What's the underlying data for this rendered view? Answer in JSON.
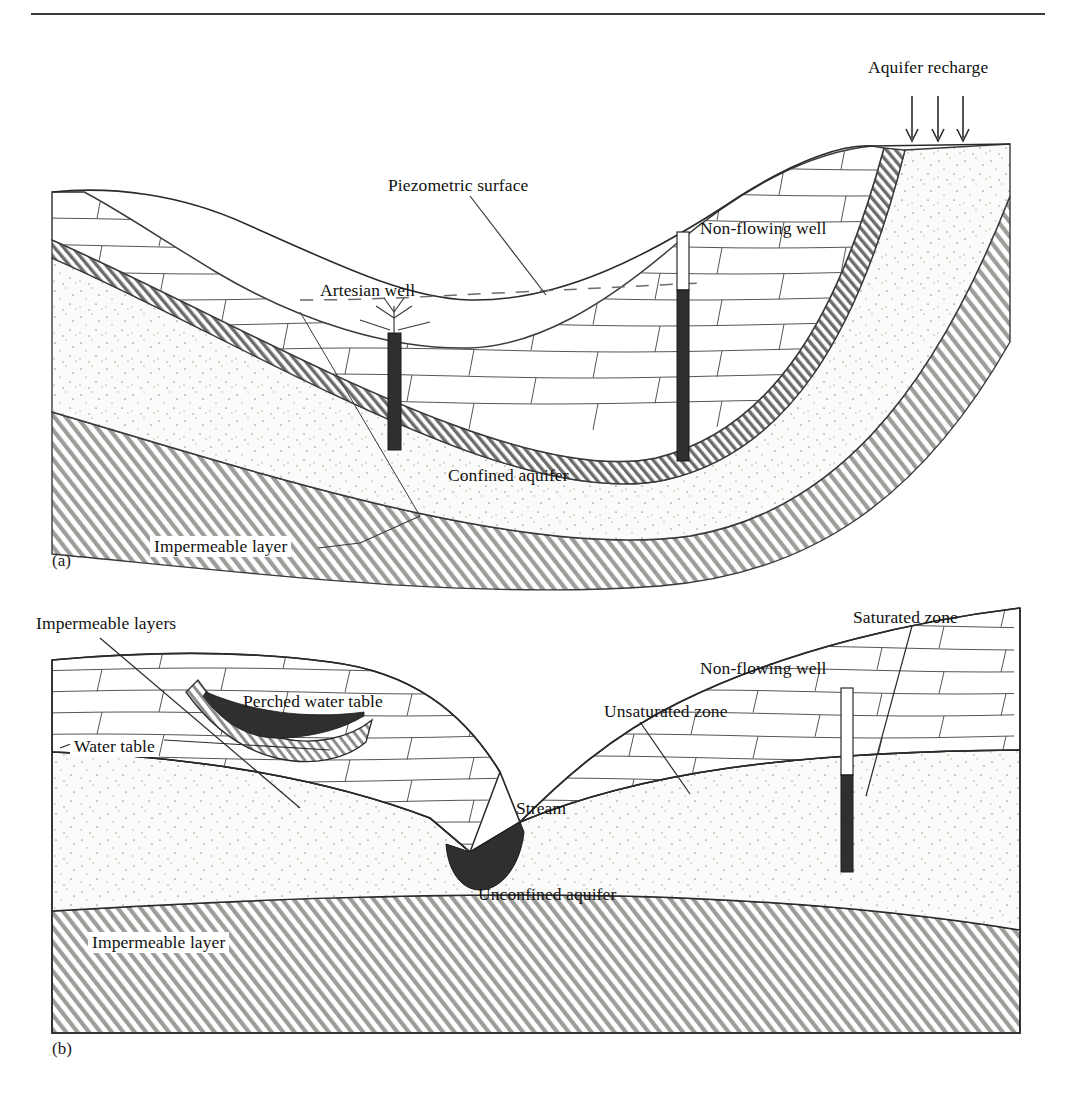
{
  "header": {
    "rule_color": "#3a3a3a",
    "text": ""
  },
  "figure": {
    "caption_tags": {
      "panel_a": "(a)",
      "panel_b": "(b)"
    },
    "line_color": "#2a2a2a",
    "water_fill": "#2f2f2f",
    "sand_fill": "#fbfbfa",
    "hatch_gray": "#8c8c8c"
  },
  "panel_a": {
    "name": "Confined aquifer system with artesian and non-flowing wells",
    "labels": [
      {
        "id": "aquifer-recharge",
        "text": "Aquifer recharge",
        "x": 868,
        "y": 58,
        "leader": false
      },
      {
        "id": "piezometric-surface",
        "text": "Piezometric surface",
        "x": 388,
        "y": 176,
        "leader": true
      },
      {
        "id": "non-flowing-well",
        "text": "Non-flowing well",
        "x": 700,
        "y": 219,
        "leader": false
      },
      {
        "id": "artesian-well",
        "text": "Artesian well",
        "x": 320,
        "y": 281,
        "leader": false
      },
      {
        "id": "confined-aquifer",
        "text": "Confined aquifer",
        "x": 448,
        "y": 466,
        "leader": false
      },
      {
        "id": "impermeable-layer",
        "text": "Impermeable layer",
        "x": 150,
        "y": 536,
        "leader": true
      }
    ],
    "recharge_arrows": {
      "count": 3,
      "x": [
        912,
        938,
        963
      ],
      "y_top": 96,
      "y_bottom": 141
    },
    "wells": [
      {
        "id": "artesian-well",
        "x": 388,
        "top": 333,
        "bottom": 450,
        "width": 13,
        "flowing": true,
        "casing_white_to": 333
      },
      {
        "id": "non-flowing-well",
        "x": 677,
        "top": 232,
        "bottom": 461,
        "width": 12,
        "flowing": false,
        "casing_white_to": 290
      }
    ],
    "strata": [
      "brick-confining-bed",
      "dark-confining-seam",
      "stippled-confined-aquifer",
      "diagonal-impermeable-layer"
    ]
  },
  "panel_b": {
    "name": "Unconfined aquifer with perched water table, stream and well",
    "labels": [
      {
        "id": "impermeable-layers",
        "text": "Impermeable layers",
        "x": 36,
        "y": 614,
        "leader": true
      },
      {
        "id": "saturated-zone",
        "text": "Saturated zone",
        "x": 853,
        "y": 608,
        "leader": true
      },
      {
        "id": "perched-water-table",
        "text": "Perched water table",
        "x": 243,
        "y": 692,
        "leader": false
      },
      {
        "id": "non-flowing-well",
        "text": "Non-flowing well",
        "x": 700,
        "y": 659,
        "leader": false
      },
      {
        "id": "unsaturated-zone",
        "text": "Unsaturated zone",
        "x": 604,
        "y": 702,
        "leader": true
      },
      {
        "id": "water-table",
        "text": "Water table",
        "x": 70,
        "y": 736,
        "leader": true
      },
      {
        "id": "stream",
        "text": "Stream",
        "x": 516,
        "y": 799,
        "leader": false
      },
      {
        "id": "unconfined-aquifer",
        "text": "Unconfined aquifer",
        "x": 478,
        "y": 885,
        "leader": false
      },
      {
        "id": "impermeable-layer",
        "text": "Impermeable layer",
        "x": 88,
        "y": 932,
        "leader": false
      }
    ],
    "wells": [
      {
        "id": "non-flowing-well",
        "x": 841,
        "top": 688,
        "bottom": 872,
        "width": 12,
        "water_top": 775
      }
    ],
    "strata": [
      "brick-unsaturated-zone",
      "stippled-saturated-zone",
      "diagonal-impermeable-layer"
    ],
    "features": [
      "perched-lens",
      "stream-channel"
    ]
  }
}
